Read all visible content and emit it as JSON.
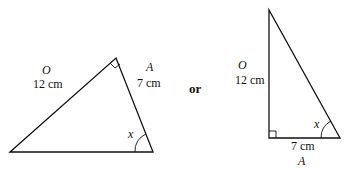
{
  "diagram": {
    "connector": "or",
    "triangle_1": {
      "opposite_letter": "O",
      "opposite_length": "12 cm",
      "adjacent_letter": "A",
      "adjacent_length": "7 cm",
      "angle_label": "x"
    },
    "triangle_2": {
      "opposite_letter": "O",
      "opposite_length": "12 cm",
      "adjacent_letter": "A",
      "adjacent_length": "7 cm",
      "angle_label": "x"
    }
  }
}
